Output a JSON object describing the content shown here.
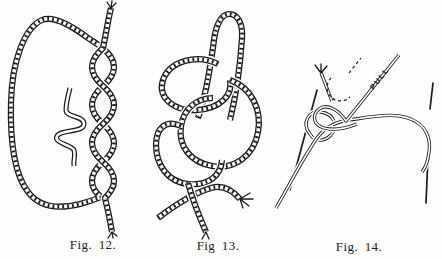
{
  "colors": {
    "ink": "#1c1c1c",
    "paper": "#fdfdfc"
  },
  "figures": [
    {
      "id": "figure-12",
      "caption": "Fig. 12."
    },
    {
      "id": "figure-13",
      "caption": "Fig 13."
    },
    {
      "id": "figure-14",
      "caption": "Fig. 14.",
      "annotation": "PULL"
    }
  ]
}
